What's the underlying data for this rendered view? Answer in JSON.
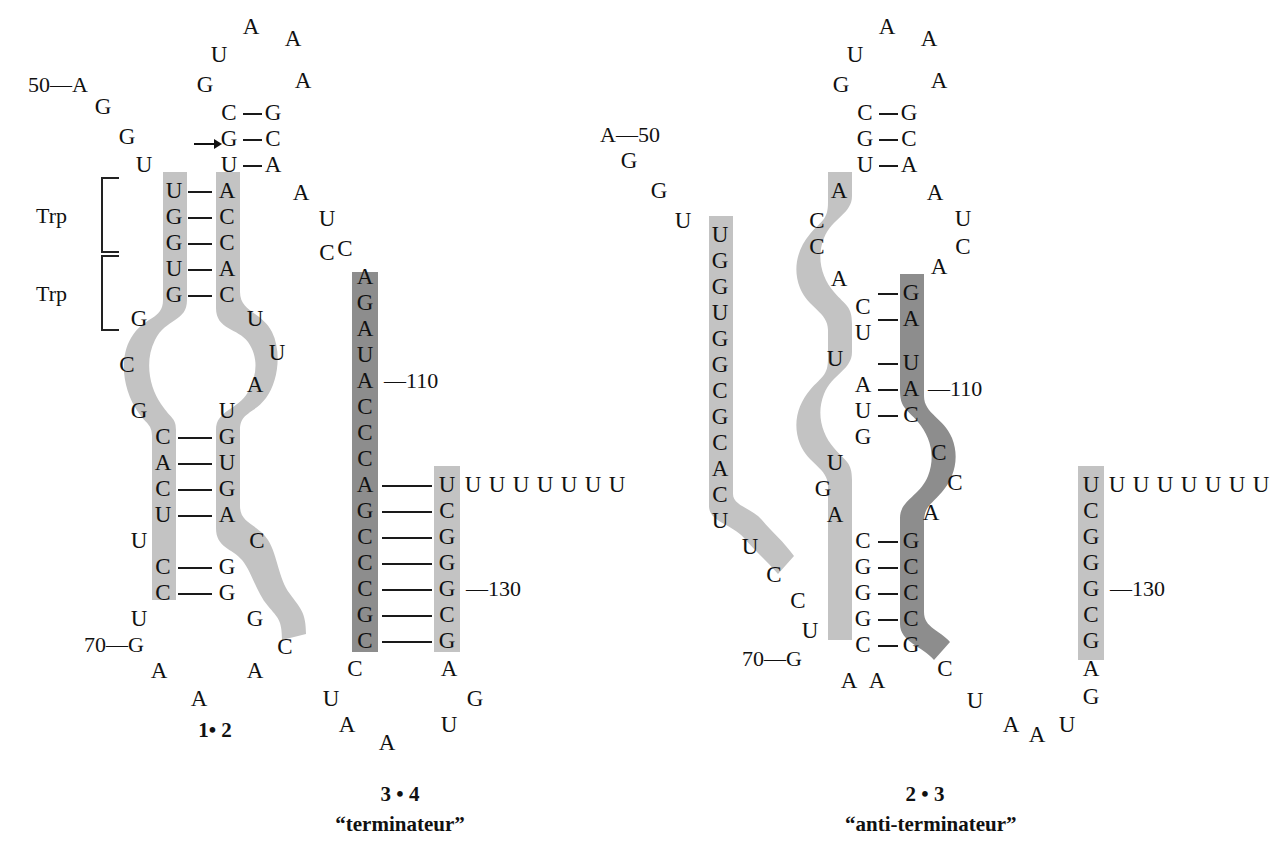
{
  "figure": {
    "type": "rna-secondary-structure-diagram",
    "title_visible": false,
    "colors": {
      "light_ribbon": "#c3c3c3",
      "dark_ribbon": "#8d8d8d",
      "text": "#111111",
      "background": "#ffffff"
    }
  },
  "panels": [
    {
      "id": "panel-1-2",
      "caption": "1• 2",
      "subcaption": "",
      "labels": {
        "trp_upper": "Trp",
        "trp_lower": "Trp",
        "pos_50": "50—A",
        "pos_70": "70—G"
      }
    },
    {
      "id": "panel-3-4",
      "caption": "3 • 4",
      "subcaption": "“terminateur”",
      "labels": {
        "pos_110": "—110",
        "pos_130": "—130"
      }
    },
    {
      "id": "panel-2-3",
      "caption": "2 • 3",
      "subcaption": "“anti-terminateur”",
      "labels": {
        "pos_50": "A—50",
        "pos_70": "70—G",
        "pos_110": "—110",
        "pos_130": "—130"
      }
    }
  ],
  "residues": {
    "panel_1_2": {
      "hairpin_loop_top": [
        "U",
        "A",
        "A",
        "G",
        "A",
        "A"
      ],
      "hairpin_stem_pairs": [
        [
          "C",
          "G"
        ],
        [
          "G",
          "C"
        ],
        [
          "U",
          "A"
        ]
      ],
      "leader_5prime_tail": [
        "50-A",
        "G",
        "G",
        "U"
      ],
      "trp1_pairs": [
        [
          "U",
          "A"
        ],
        [
          "G",
          "C"
        ],
        [
          "G",
          "C"
        ]
      ],
      "trp2_pairs": [
        [
          "U",
          "A"
        ],
        [
          "G",
          "C"
        ]
      ],
      "left_strand_bulge": [
        "G",
        "C",
        "G"
      ],
      "right_strand_bulge": [
        "U",
        "U",
        "A",
        "U"
      ],
      "mid_pairs": [
        [
          "C",
          "G"
        ],
        [
          "A",
          "U"
        ],
        [
          "C",
          "G"
        ],
        [
          "U",
          "A"
        ]
      ],
      "lower_bulge_left": [
        "U"
      ],
      "lower_bulge_right": [
        "C"
      ],
      "lower_pairs": [
        [
          "C",
          "G"
        ],
        [
          "C",
          "G"
        ]
      ],
      "tail_left": [
        "U",
        "70-G",
        "A",
        "A"
      ],
      "tail_right": [
        "G",
        "C",
        "A"
      ],
      "right_loop_side": [
        "A",
        "U",
        "C"
      ]
    },
    "panel_3_4": {
      "top_free": [
        "C",
        "A"
      ],
      "left_strand_dark": [
        "G",
        "A",
        "U",
        "A",
        "C",
        "C",
        "C",
        "A",
        "G",
        "C",
        "C",
        "C",
        "C",
        "G",
        "C"
      ],
      "right_strand_light": [
        "U",
        "C",
        "G",
        "G",
        "G",
        "C",
        "G"
      ],
      "pairs": [
        [
          "A",
          "U"
        ],
        [
          "G",
          "C"
        ],
        [
          "C",
          "G"
        ],
        [
          "G",
          "C"
        ],
        [
          "C",
          "G"
        ],
        [
          "C",
          "G"
        ],
        [
          "C",
          "G"
        ],
        [
          "G",
          "C"
        ],
        [
          "C",
          "G"
        ]
      ],
      "u_tract": [
        "U",
        "U",
        "U",
        "U",
        "U",
        "U",
        "U"
      ],
      "bottom_left_tail": [
        "C",
        "U",
        "A",
        "A"
      ],
      "bottom_right_tail": [
        "A",
        "G",
        "U"
      ]
    },
    "panel_2_3": {
      "hairpin_loop_top": [
        "U",
        "A",
        "A",
        "G",
        "A",
        "A"
      ],
      "hairpin_stem_pairs": [
        [
          "C",
          "G"
        ],
        [
          "G",
          "C"
        ],
        [
          "U",
          "A"
        ]
      ],
      "leader_5prime_tail": [
        "A-50",
        "G",
        "G",
        "U"
      ],
      "left_light_column": [
        "U",
        "G",
        "G",
        "U",
        "G",
        "G",
        "C",
        "G",
        "C",
        "A",
        "C",
        "U",
        "U",
        "C",
        "C",
        "U"
      ],
      "mid_light_strand": [
        "A",
        "C",
        "C",
        "A",
        "C",
        "U",
        "U",
        "A",
        "U",
        "G",
        "U",
        "G",
        "A",
        "C",
        "G",
        "G",
        "G",
        "C",
        "A",
        "A"
      ],
      "dark_strand": [
        "G",
        "A",
        "U",
        "A",
        "C",
        "C",
        "C",
        "A",
        "G",
        "C",
        "C",
        "C",
        "G",
        "C"
      ],
      "pairs": [
        [
          "C",
          "G"
        ],
        [
          "U",
          "A"
        ],
        [
          "A",
          "U"
        ],
        [
          "U",
          "A"
        ],
        [
          "G",
          "C"
        ],
        [
          "C",
          "G"
        ],
        [
          "G",
          "C"
        ],
        [
          "G",
          "C"
        ],
        [
          "G",
          "C"
        ],
        [
          "C",
          "G"
        ]
      ],
      "right_loop": [
        "A",
        "A",
        "U",
        "C",
        "A"
      ],
      "bottom_tail": [
        "C",
        "U",
        "A",
        "A"
      ],
      "terminator_light_column": [
        "U",
        "C",
        "G",
        "G",
        "G",
        "C",
        "G",
        "A",
        "G"
      ],
      "u_tract": [
        "U",
        "U",
        "U",
        "U",
        "U",
        "U",
        "U"
      ],
      "bottom_right_tail": [
        "A",
        "A",
        "U"
      ]
    }
  },
  "static_text": {
    "arrow_icon": "arrow-right"
  }
}
